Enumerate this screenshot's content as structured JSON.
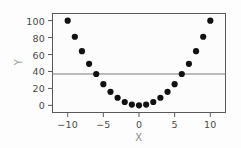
{
  "chart_data": {
    "type": "scatter",
    "title": "",
    "xlabel": "X",
    "ylabel": "Y",
    "xlim": [
      -12.2,
      12.2
    ],
    "ylim": [
      -9,
      109
    ],
    "grid": false,
    "legend": null,
    "xticks": [
      -10,
      -5,
      0,
      5,
      10
    ],
    "xticklabels": [
      "−10",
      "−5",
      "0",
      "5",
      "10"
    ],
    "yticks": [
      0,
      20,
      40,
      60,
      80,
      100
    ],
    "yticklabels": [
      "0",
      "20",
      "40",
      "60",
      "80",
      "100"
    ],
    "marker": {
      "shape": "circle",
      "color": "#111111",
      "size": 3.1
    },
    "series": [
      {
        "name": "y = x^2",
        "x": [
          -10,
          -9,
          -8,
          -7,
          -6,
          -5,
          -4,
          -3,
          -2,
          -1,
          0,
          1,
          2,
          3,
          4,
          5,
          6,
          7,
          8,
          9,
          10
        ],
        "y": [
          100,
          81,
          64,
          49,
          37,
          25,
          16,
          9,
          4,
          1,
          0,
          1,
          4,
          9,
          16,
          25,
          37,
          49,
          64,
          81,
          100
        ]
      }
    ],
    "annotations": [
      {
        "kind": "horizontal-line",
        "y": 37,
        "color": "#7a7a7a",
        "span": "full-width"
      }
    ]
  },
  "axis_titles": {
    "x": "X",
    "y": "Y"
  }
}
